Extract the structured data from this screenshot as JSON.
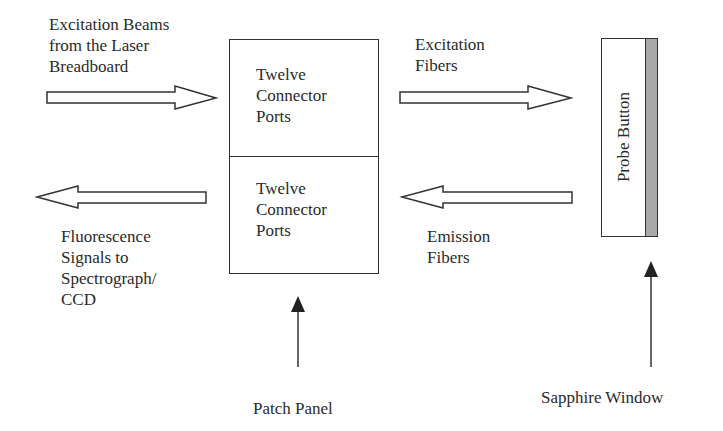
{
  "diagram": {
    "labels": {
      "excitation_beams": [
        "Excitation Beams",
        "from the Laser",
        "Breadboard"
      ],
      "fluorescence": [
        "Fluorescence",
        "Signals to",
        "Spectrograph/",
        "CCD"
      ],
      "excitation_fibers": [
        "Excitation",
        "Fibers"
      ],
      "emission_fibers": [
        "Emission",
        "Fibers"
      ],
      "patch_panel": "Patch Panel",
      "sapphire_window": "Sapphire Window"
    },
    "patch_panel_box": {
      "top_section": [
        "Twelve",
        "Connector",
        "Ports"
      ],
      "bottom_section": [
        "Twelve",
        "Connector",
        "Ports"
      ]
    },
    "probe": {
      "label": "Probe Button",
      "window_color": "#a9a9a9"
    },
    "arrows": [
      {
        "id": "excitation-beams-arrow",
        "direction": "right",
        "style": "hollow"
      },
      {
        "id": "excitation-fibers-arrow",
        "direction": "right",
        "style": "hollow"
      },
      {
        "id": "fluorescence-arrow",
        "direction": "left",
        "style": "hollow"
      },
      {
        "id": "emission-fibers-arrow",
        "direction": "left",
        "style": "hollow"
      },
      {
        "id": "patch-panel-pointer",
        "direction": "up",
        "style": "line"
      },
      {
        "id": "sapphire-window-pointer",
        "direction": "up",
        "style": "line"
      }
    ]
  }
}
